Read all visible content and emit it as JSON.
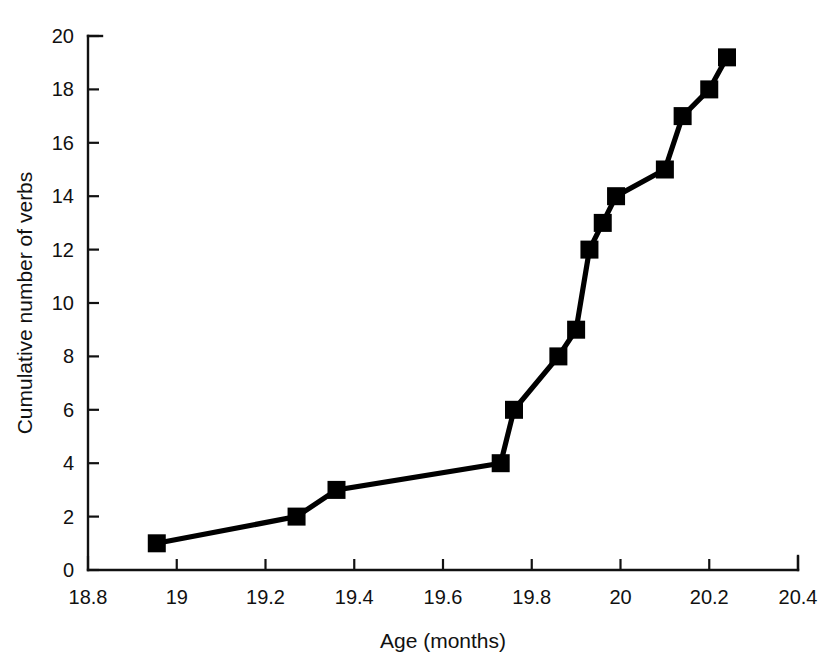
{
  "chart_data": {
    "type": "line",
    "title": "",
    "subtitle": "",
    "xlabel": "Age (months)",
    "ylabel": "Cumulative number of verbs",
    "xlim": [
      18.8,
      20.4
    ],
    "ylim": [
      0,
      20
    ],
    "xticks": [
      18.8,
      19,
      19.2,
      19.4,
      19.6,
      19.8,
      20,
      20.2,
      20.4
    ],
    "xtick_labels": [
      "18.8",
      "19",
      "19.2",
      "19.4",
      "19.6",
      "19.8",
      "20",
      "20.2",
      "20.4"
    ],
    "yticks": [
      0,
      2,
      4,
      6,
      8,
      10,
      12,
      14,
      16,
      18,
      20
    ],
    "ytick_labels": [
      "0",
      "2",
      "4",
      "6",
      "8",
      "10",
      "12",
      "14",
      "16",
      "18",
      "20"
    ],
    "grid": false,
    "legend": "none",
    "marker": "square",
    "marker_color": "#000000",
    "line_color": "#000000",
    "background_color": "#ffffff",
    "series": [
      {
        "name": "Cumulative verbs",
        "x": [
          18.955,
          19.27,
          19.36,
          19.73,
          19.76,
          19.86,
          19.9,
          19.93,
          19.96,
          19.99,
          20.1,
          20.14,
          20.2,
          20.24
        ],
        "values": [
          1,
          2,
          3,
          4,
          6,
          8,
          9,
          12,
          13,
          14,
          15,
          17,
          18,
          19.2
        ]
      }
    ]
  },
  "figure": {
    "xlabel": "Age (months)",
    "ylabel": "Cumulative number of verbs"
  }
}
